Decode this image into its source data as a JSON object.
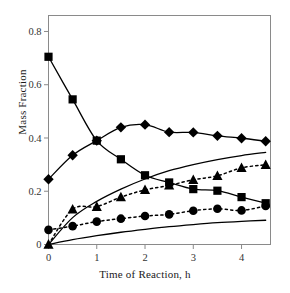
{
  "chart_data": {
    "type": "line",
    "title": "",
    "xlabel": "Time of Reaction, h",
    "ylabel": "Mass Fraction",
    "xlim": [
      0,
      4.6
    ],
    "ylim": [
      0,
      0.86
    ],
    "xticks": [
      "0",
      "1",
      "2",
      "3",
      "4"
    ],
    "xtick_values": [
      0,
      1,
      2,
      3,
      4
    ],
    "yticks": [
      "0",
      "0.2",
      "0.4",
      "0.6",
      "0.8"
    ],
    "ytick_values": [
      0,
      0.2,
      0.4,
      0.6,
      0.8
    ],
    "grid": false,
    "legend": "none",
    "frame": "box",
    "series": [
      {
        "name": "squares",
        "marker": "square",
        "line_style": "solid",
        "color": "#000000",
        "x": [
          0,
          0.5,
          1,
          1.5,
          2,
          2.5,
          3,
          3.5,
          4,
          4.5
        ],
        "values": [
          0.705,
          0.545,
          0.39,
          0.32,
          0.26,
          0.233,
          0.208,
          0.202,
          0.178,
          0.155
        ]
      },
      {
        "name": "diamonds",
        "marker": "diamond",
        "line_style": "solid",
        "color": "#000000",
        "x": [
          0,
          0.5,
          1,
          1.5,
          2,
          2.5,
          3,
          3.5,
          4,
          4.5
        ],
        "values": [
          0.245,
          0.335,
          0.39,
          0.44,
          0.45,
          0.422,
          0.421,
          0.408,
          0.399,
          0.388
        ]
      },
      {
        "name": "triangles",
        "marker": "triangle",
        "line_style": "dotted",
        "color": "#000000",
        "x": [
          0,
          0.5,
          1,
          1.5,
          2,
          2.5,
          3,
          3.5,
          4,
          4.5
        ],
        "values": [
          0.0,
          0.132,
          0.142,
          0.178,
          0.205,
          0.222,
          0.243,
          0.258,
          0.288,
          0.299
        ]
      },
      {
        "name": "circles",
        "marker": "circle",
        "line_style": "dotted",
        "color": "#000000",
        "x": [
          0,
          0.5,
          1,
          1.5,
          2,
          2.5,
          3,
          3.5,
          4,
          4.5
        ],
        "values": [
          0.055,
          0.069,
          0.086,
          0.097,
          0.107,
          0.113,
          0.127,
          0.134,
          0.128,
          0.145
        ]
      },
      {
        "name": "model-curve-upper",
        "marker": "none",
        "line_style": "solid",
        "color": "#000000",
        "x": [
          0,
          0.5,
          1,
          1.5,
          2,
          2.5,
          3,
          3.5,
          4,
          4.5
        ],
        "values": [
          0.0,
          0.101,
          0.162,
          0.208,
          0.246,
          0.277,
          0.3,
          0.319,
          0.334,
          0.346
        ]
      },
      {
        "name": "model-curve-lower",
        "marker": "none",
        "line_style": "solid",
        "color": "#000000",
        "x": [
          0,
          0.5,
          1,
          1.5,
          2,
          2.5,
          3,
          3.5,
          4,
          4.5
        ],
        "values": [
          0.0,
          0.018,
          0.033,
          0.046,
          0.057,
          0.067,
          0.075,
          0.082,
          0.087,
          0.091
        ]
      }
    ]
  },
  "axes": {
    "x_label": "Time of Reaction, h",
    "y_label": "Mass Fraction"
  },
  "style": {
    "frame_color": "#8a8a8a",
    "marker_color": "#000000",
    "line_color": "#000000",
    "background": "#ffffff"
  }
}
